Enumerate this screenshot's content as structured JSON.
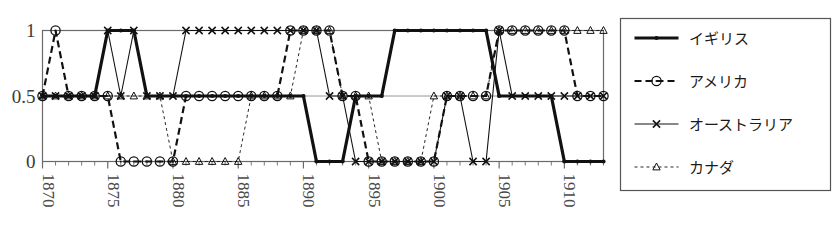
{
  "chart_data": {
    "type": "line",
    "title": "",
    "xlabel": "",
    "ylabel": "",
    "xlim": [
      1870,
      1913
    ],
    "ylim": [
      0,
      1
    ],
    "yticks": [
      0,
      0.5,
      1
    ],
    "ytick_labels": [
      "0",
      "0.5",
      "1"
    ],
    "xticks": [
      1870,
      1875,
      1880,
      1885,
      1890,
      1895,
      1900,
      1905,
      1910
    ],
    "xtick_labels": [
      "1870",
      "1875",
      "1880",
      "1885",
      "1890",
      "1895",
      "1900",
      "1905",
      "1910"
    ],
    "xtick_rotation": 90,
    "grid": true,
    "legend_position": "right-outside",
    "x": [
      1870,
      1871,
      1872,
      1873,
      1874,
      1875,
      1876,
      1877,
      1878,
      1879,
      1880,
      1881,
      1882,
      1883,
      1884,
      1885,
      1886,
      1887,
      1888,
      1889,
      1890,
      1891,
      1892,
      1893,
      1894,
      1895,
      1896,
      1897,
      1898,
      1899,
      1900,
      1901,
      1902,
      1903,
      1904,
      1905,
      1906,
      1907,
      1908,
      1909,
      1910,
      1911,
      1912,
      1913
    ],
    "series": [
      {
        "name": "イギリス",
        "marker": "dot",
        "linestyle": "solid",
        "linewidth": 3.2,
        "color": "#111111",
        "values": [
          0.5,
          0.5,
          0.5,
          0.5,
          0.5,
          1,
          1,
          1,
          0.5,
          0.5,
          0.5,
          0.5,
          0.5,
          0.5,
          0.5,
          0.5,
          0.5,
          0.5,
          0.5,
          0.5,
          0.5,
          0,
          0,
          0,
          0.5,
          0.5,
          0.5,
          1,
          1,
          1,
          1,
          1,
          1,
          1,
          1,
          0.5,
          0.5,
          0.5,
          0.5,
          0.5,
          0,
          0,
          0,
          0
        ]
      },
      {
        "name": "アメリカ",
        "marker": "circle",
        "linestyle": "dashed",
        "linewidth": 2.2,
        "color": "#111111",
        "values": [
          0.5,
          1,
          0.5,
          0.5,
          0.5,
          0.5,
          0,
          0,
          0,
          0,
          0,
          0.5,
          0.5,
          0.5,
          0.5,
          0.5,
          0.5,
          0.5,
          0.5,
          1,
          1,
          1,
          1,
          0.5,
          0.5,
          0,
          0,
          0,
          0,
          0,
          0,
          0.5,
          0.5,
          0.5,
          0.5,
          1,
          1,
          1,
          1,
          1,
          1,
          0.5,
          0.5,
          0.5
        ]
      },
      {
        "name": "オーストラリア",
        "marker": "x",
        "linestyle": "solid",
        "linewidth": 1.1,
        "color": "#111111",
        "values": [
          0.5,
          0.5,
          0.5,
          0.5,
          0.5,
          1,
          0.5,
          1,
          0.5,
          0.5,
          0.5,
          1,
          1,
          1,
          1,
          1,
          1,
          1,
          1,
          1,
          1,
          1,
          0.5,
          0.5,
          0,
          0,
          0,
          0,
          0,
          0,
          0,
          0.5,
          0.5,
          0,
          0,
          1,
          0.5,
          0.5,
          0.5,
          0.5,
          0.5,
          0.5,
          0.5,
          0.5
        ]
      },
      {
        "name": "カナダ",
        "marker": "triangle",
        "linestyle": "dotted-dashed",
        "linewidth": 0.9,
        "color": "#111111",
        "values": [
          0.5,
          0.5,
          0.5,
          0.5,
          0.5,
          0.5,
          0.5,
          0.5,
          0.5,
          0.5,
          0,
          0,
          0,
          0,
          0,
          0,
          0.5,
          0.5,
          0.5,
          0.5,
          1,
          1,
          1,
          0.5,
          0.5,
          0.5,
          0,
          0,
          0,
          0,
          0.5,
          0.5,
          0.5,
          0.5,
          0.5,
          1,
          1,
          1,
          1,
          1,
          1,
          1,
          1,
          1
        ]
      }
    ]
  },
  "legend": {
    "items": [
      {
        "label": "イギリス",
        "marker": "dot",
        "linestyle": "solid",
        "linewidth": 3.2
      },
      {
        "label": "アメリカ",
        "marker": "circle",
        "linestyle": "dashed",
        "linewidth": 2.2
      },
      {
        "label": "オーストラリア",
        "marker": "x",
        "linestyle": "solid",
        "linewidth": 1.1
      },
      {
        "label": "カナダ",
        "marker": "triangle",
        "linestyle": "dotted-dashed",
        "linewidth": 0.9
      }
    ]
  },
  "colors": {
    "ink": "#111111",
    "axis": "#6a6a6a",
    "grid": "#8a8a8a",
    "background": "#ffffff"
  }
}
